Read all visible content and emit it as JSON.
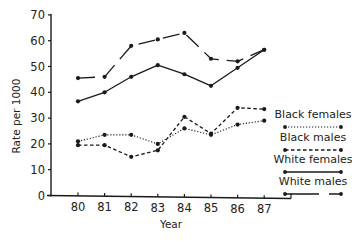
{
  "chart_data": {
    "type": "line",
    "title": "",
    "xlabel": "Year",
    "ylabel": "Rate per 1000",
    "x": [
      "80",
      "81",
      "82",
      "83",
      "84",
      "85",
      "86",
      "87"
    ],
    "ylim": [
      0,
      70
    ],
    "yticks": [
      0,
      10,
      20,
      30,
      40,
      50,
      60,
      70
    ],
    "grid": false,
    "legend_position": "right",
    "series": [
      {
        "name": "Black females",
        "style": "dotted",
        "values": [
          21,
          23.5,
          23.5,
          20,
          26,
          23.5,
          27.5,
          29
        ]
      },
      {
        "name": "Black males",
        "style": "dashed",
        "values": [
          19.5,
          19.5,
          15,
          17.5,
          30.5,
          24,
          34,
          33.5
        ]
      },
      {
        "name": "White females",
        "style": "solid",
        "values": [
          36.5,
          40,
          46,
          50.5,
          47,
          42.5,
          49.5,
          56.5
        ]
      },
      {
        "name": "White males",
        "style": "long-dash",
        "values": [
          45.5,
          46,
          58,
          60.5,
          63,
          53,
          52,
          56.5
        ]
      }
    ]
  },
  "colors": {
    "ink": "#1a1a1a",
    "background": "#ffffff"
  }
}
